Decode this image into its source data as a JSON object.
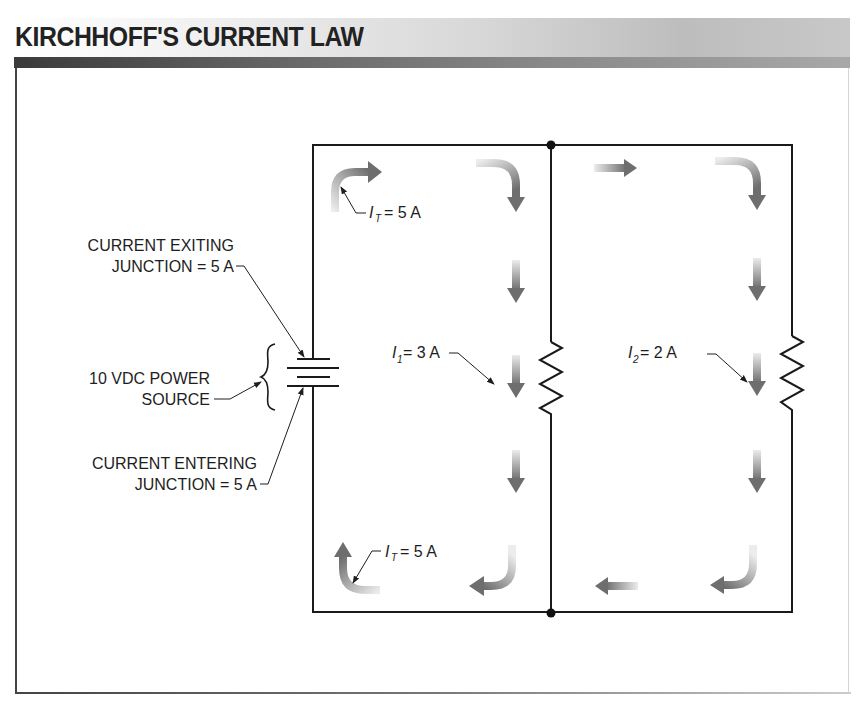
{
  "header": {
    "title": "KIRCHHOFF'S CURRENT LAW"
  },
  "labels": {
    "exiting_line1": "CURRENT EXITING",
    "exiting_line2": "JUNCTION = 5 A",
    "source_line1": "10 VDC POWER",
    "source_line2": "SOURCE",
    "entering_line1": "CURRENT ENTERING",
    "entering_line2": "JUNCTION = 5 A",
    "it_top": {
      "symbol": "I",
      "subscript": "T",
      "value": "= 5 A"
    },
    "it_bottom": {
      "symbol": "I",
      "subscript": "T",
      "value": "= 5 A"
    },
    "i1": {
      "symbol": "I",
      "subscript": "1",
      "value": "= 3 A"
    },
    "i2": {
      "symbol": "I",
      "subscript": "2",
      "value": "= 2 A"
    }
  },
  "circuit": {
    "source_voltage": "10 VDC",
    "total_current": "5 A",
    "branch_currents": [
      "3 A",
      "2 A"
    ],
    "components": [
      "battery",
      "resistor-1",
      "resistor-2"
    ],
    "junctions": 2
  },
  "colors": {
    "wire": "#1a1a1a",
    "arrow_dark": "#6e6e6e",
    "arrow_light": "#e6e6e6",
    "header_dark": "#3a3a3a",
    "title": "#222222"
  }
}
